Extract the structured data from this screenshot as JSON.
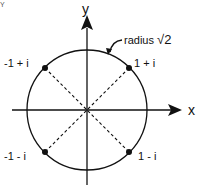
{
  "diagram": {
    "corner_mark": "Y",
    "axes": {
      "x_label": "x",
      "y_label": "y"
    },
    "circle": {
      "label": "radius √2",
      "radius_text": "radius",
      "radius_value": "√2"
    },
    "points": [
      {
        "label": "1 + i",
        "x": 1,
        "y": 1
      },
      {
        "label": "-1 + i",
        "x": -1,
        "y": 1
      },
      {
        "label": "-1 - i",
        "x": -1,
        "y": -1
      },
      {
        "label": "1 - i",
        "x": 1,
        "y": -1
      }
    ],
    "colors": {
      "stroke": "#111111",
      "background": "#ffffff"
    }
  }
}
